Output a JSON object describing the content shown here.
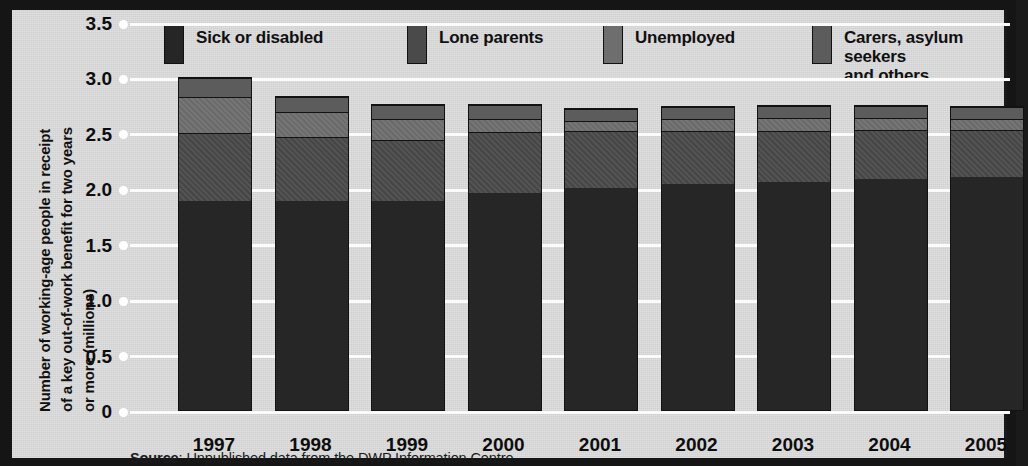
{
  "axis": {
    "y_title_line1": "Number of working-age people in receipt",
    "y_title_line2": "of a key out-of-work benefit for two years",
    "y_title_line3": "or more (millions)",
    "y_title_full": "Number of working-age people in receipt of a key out-of-work benefit for two years or more (millions)",
    "y_ticks": [
      "3.5",
      "3.0",
      "2.5",
      "2.0",
      "1.5",
      "1.0",
      "0.5",
      "0"
    ]
  },
  "legend": {
    "items": [
      {
        "label": "Sick or disabled",
        "color": "#262626"
      },
      {
        "label": "Lone parents",
        "color": "#4a4a4a"
      },
      {
        "label": "Unemployed",
        "color": "#6e6e6e"
      },
      {
        "label": "Carers, asylum seekers\nand others",
        "color": "#5c5c5c"
      }
    ]
  },
  "source": {
    "prefix": "Source",
    "text": ": Unpublished data from the DWP Information Centre"
  },
  "chart_data": {
    "type": "bar",
    "subtype": "stacked-vertical",
    "title": "",
    "xlabel": "",
    "ylabel": "Number of working-age people in receipt of a key out-of-work benefit for two years or more (millions)",
    "ylim": [
      0,
      3.5
    ],
    "ytick_values": [
      0,
      0.5,
      1.0,
      1.5,
      2.0,
      2.5,
      3.0,
      3.5
    ],
    "grid": true,
    "grid_axis": "y",
    "legend_position": "top",
    "categories": [
      "1997",
      "1998",
      "1999",
      "2000",
      "2001",
      "2002",
      "2003",
      "2004",
      "2005"
    ],
    "series": [
      {
        "name": "Sick or disabled",
        "color": "#262626",
        "values": [
          1.88,
          1.88,
          1.88,
          1.95,
          2.0,
          2.03,
          2.05,
          2.08,
          2.1
        ]
      },
      {
        "name": "Lone parents",
        "color": "#4a4a4a",
        "values": [
          0.61,
          0.58,
          0.55,
          0.55,
          0.51,
          0.48,
          0.46,
          0.44,
          0.42
        ]
      },
      {
        "name": "Unemployed",
        "color": "#6e6e6e",
        "values": [
          0.33,
          0.22,
          0.19,
          0.12,
          0.09,
          0.11,
          0.12,
          0.11,
          0.1
        ]
      },
      {
        "name": "Carers, asylum seekers and others",
        "color": "#5c5c5c",
        "values": [
          0.17,
          0.14,
          0.13,
          0.13,
          0.11,
          0.11,
          0.11,
          0.11,
          0.11
        ]
      }
    ],
    "totals": [
      2.99,
      2.82,
      2.75,
      2.75,
      2.71,
      2.73,
      2.74,
      2.74,
      2.73
    ],
    "units": "millions"
  }
}
